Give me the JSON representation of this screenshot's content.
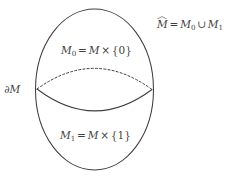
{
  "figure": {
    "name": "double-of-manifold-diagram",
    "background_color": "#ffffff",
    "stroke_color": "#3f3f3f",
    "text_color": "#3f3f3f",
    "labels": {
      "union": {
        "plain": "M̂ = M₀ ∪ M₁",
        "lhs_symbol": "M",
        "equals": "=",
        "rhs_first": "M",
        "rhs_first_sub": "0",
        "union_operator": "∪",
        "rhs_second": "M",
        "rhs_second_sub": "1"
      },
      "upper_copy": {
        "plain": "M₀ = M × {0}",
        "symbol": "M",
        "symbol_sub": "0",
        "equals": "=",
        "base": "M",
        "times": "×",
        "set": "{0}"
      },
      "lower_copy": {
        "plain": "M₁ = M × {1}",
        "symbol": "M",
        "symbol_sub": "1",
        "equals": "=",
        "base": "M",
        "times": "×",
        "set": "{1}"
      },
      "boundary": {
        "plain": "∂M",
        "partial": "∂",
        "symbol": "M"
      }
    },
    "shapes": {
      "outer_ellipse": {
        "cx": 94.5,
        "cy": 89.5,
        "rx": 59.0,
        "ry": 80.5,
        "style": "solid"
      },
      "boundary_back_arc": {
        "style": "dashed",
        "from_x": 37.0,
        "from_y": 89.0,
        "to_x": 152.0,
        "to_y": 89.5,
        "apex_y": 68.0
      },
      "boundary_front_arc": {
        "style": "solid",
        "from_x": 37.0,
        "from_y": 89.0,
        "to_x": 152.0,
        "to_y": 89.5,
        "nadir_y": 111.0
      }
    }
  }
}
